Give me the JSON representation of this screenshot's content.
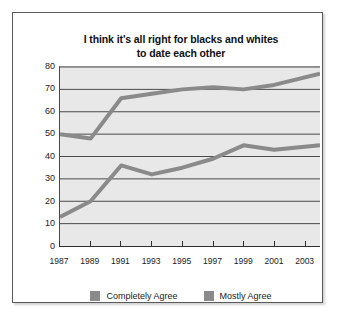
{
  "figure": {
    "background_color": "#ffffff",
    "border_color": "#5a5a5a"
  },
  "title": {
    "line1": "I think it's all right for blacks and whites",
    "line2": "to date each other"
  },
  "legend": {
    "items": [
      {
        "label": "Completely Agree",
        "color": "#8a8a8a",
        "swatch_name": "legend-swatch-completely-agree"
      },
      {
        "label": "Mostly Agree",
        "color": "#8a8a8a",
        "swatch_name": "legend-swatch-mostly-agree"
      }
    ]
  },
  "chart_data": {
    "type": "line",
    "title": "I think it's all right for blacks and whites to date each other",
    "xlabel": "",
    "ylabel": "",
    "x": [
      1987,
      1988,
      1989,
      1990,
      1991,
      1992,
      1993,
      1994,
      1995,
      1996,
      1997,
      1998,
      1999,
      2000,
      2001,
      2002,
      2003,
      2004
    ],
    "x_tick_labels": [
      "1987",
      "1989",
      "1991",
      "1993",
      "1995",
      "1997",
      "1999",
      "2001",
      "2003"
    ],
    "x_tick_values": [
      1987,
      1989,
      1991,
      1993,
      1995,
      1997,
      1999,
      2001,
      2003
    ],
    "xlim": [
      1987,
      2004
    ],
    "ylim": [
      0,
      80
    ],
    "y_ticks": [
      0,
      10,
      20,
      30,
      40,
      50,
      60,
      70,
      80
    ],
    "y_tick_labels": [
      "0",
      "10",
      "20",
      "30",
      "40",
      "50",
      "60",
      "70",
      "80"
    ],
    "grid": true,
    "grid_axis": "y",
    "grid_color": "#4a4a4a",
    "plot_background": "#e8e8e8",
    "legend_position": "bottom",
    "series": [
      {
        "name": "Mostly Agree",
        "color": "#8a8a8a",
        "x": [
          1987,
          1989,
          1991,
          1993,
          1995,
          1997,
          1999,
          2001,
          2004
        ],
        "values": [
          50,
          48,
          66,
          68,
          70,
          71,
          70,
          72,
          77
        ]
      },
      {
        "name": "Completely Agree",
        "color": "#8a8a8a",
        "x": [
          1987,
          1989,
          1991,
          1993,
          1995,
          1997,
          1999,
          2001,
          2004
        ],
        "values": [
          13,
          20,
          36,
          32,
          35,
          39,
          45,
          43,
          45
        ]
      }
    ]
  }
}
